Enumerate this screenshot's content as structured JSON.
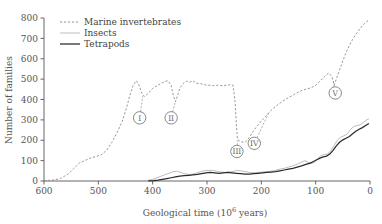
{
  "chart_data": {
    "type": "line",
    "title": "",
    "xlabel": "Geological time (10⁶ years)",
    "ylabel": "Number of families",
    "xlim": [
      600,
      0
    ],
    "ylim": [
      0,
      800
    ],
    "x_ticks": [
      600,
      500,
      400,
      300,
      200,
      100,
      0
    ],
    "y_ticks": [
      0,
      100,
      200,
      300,
      400,
      500,
      600,
      700,
      800
    ],
    "x_reversed": true,
    "grid": false,
    "legend_position": "top-left",
    "series": [
      {
        "name": "Marine invertebrates",
        "style": "dashed",
        "color": "#8c8c8c",
        "points": [
          [
            600,
            2
          ],
          [
            585,
            4
          ],
          [
            570,
            12
          ],
          [
            555,
            35
          ],
          [
            545,
            62
          ],
          [
            535,
            88
          ],
          [
            525,
            100
          ],
          [
            515,
            112
          ],
          [
            505,
            120
          ],
          [
            495,
            128
          ],
          [
            485,
            150
          ],
          [
            475,
            190
          ],
          [
            465,
            240
          ],
          [
            455,
            300
          ],
          [
            448,
            360
          ],
          [
            442,
            420
          ],
          [
            436,
            470
          ],
          [
            430,
            492
          ],
          [
            425,
            470
          ],
          [
            420,
            430
          ],
          [
            415,
            415
          ],
          [
            408,
            430
          ],
          [
            400,
            455
          ],
          [
            392,
            468
          ],
          [
            385,
            478
          ],
          [
            378,
            488
          ],
          [
            372,
            492
          ],
          [
            366,
            470
          ],
          [
            362,
            420
          ],
          [
            358,
            390
          ],
          [
            354,
            420
          ],
          [
            350,
            455
          ],
          [
            344,
            478
          ],
          [
            338,
            490
          ],
          [
            332,
            485
          ],
          [
            326,
            492
          ],
          [
            320,
            480
          ],
          [
            312,
            478
          ],
          [
            304,
            472
          ],
          [
            296,
            470
          ],
          [
            288,
            468
          ],
          [
            280,
            470
          ],
          [
            272,
            468
          ],
          [
            264,
            470
          ],
          [
            258,
            472
          ],
          [
            252,
            470
          ],
          [
            248,
            380
          ],
          [
            246,
            280
          ],
          [
            244,
            205
          ],
          [
            240,
            196
          ],
          [
            236,
            192
          ],
          [
            230,
            190
          ],
          [
            226,
            200
          ],
          [
            222,
            215
          ],
          [
            216,
            240
          ],
          [
            210,
            262
          ],
          [
            204,
            282
          ],
          [
            198,
            300
          ],
          [
            192,
            318
          ],
          [
            186,
            336
          ],
          [
            180,
            352
          ],
          [
            172,
            370
          ],
          [
            164,
            385
          ],
          [
            156,
            400
          ],
          [
            148,
            412
          ],
          [
            140,
            424
          ],
          [
            132,
            436
          ],
          [
            124,
            446
          ],
          [
            116,
            452
          ],
          [
            108,
            458
          ],
          [
            100,
            470
          ],
          [
            92,
            490
          ],
          [
            84,
            512
          ],
          [
            76,
            530
          ],
          [
            70,
            512
          ],
          [
            66,
            470
          ],
          [
            62,
            500
          ],
          [
            56,
            545
          ],
          [
            50,
            590
          ],
          [
            44,
            630
          ],
          [
            38,
            665
          ],
          [
            32,
            695
          ],
          [
            26,
            720
          ],
          [
            20,
            742
          ],
          [
            14,
            762
          ],
          [
            8,
            778
          ],
          [
            2,
            790
          ]
        ]
      },
      {
        "name": "Insects",
        "style": "solid-thin",
        "color": "#b0b0b0",
        "points": [
          [
            420,
            1
          ],
          [
            410,
            3
          ],
          [
            400,
            8
          ],
          [
            392,
            16
          ],
          [
            386,
            22
          ],
          [
            380,
            28
          ],
          [
            374,
            34
          ],
          [
            368,
            40
          ],
          [
            362,
            46
          ],
          [
            356,
            48
          ],
          [
            350,
            44
          ],
          [
            344,
            38
          ],
          [
            338,
            34
          ],
          [
            332,
            32
          ],
          [
            326,
            34
          ],
          [
            320,
            38
          ],
          [
            314,
            44
          ],
          [
            306,
            50
          ],
          [
            298,
            52
          ],
          [
            290,
            52
          ],
          [
            282,
            48
          ],
          [
            274,
            44
          ],
          [
            266,
            42
          ],
          [
            258,
            44
          ],
          [
            250,
            48
          ],
          [
            244,
            52
          ],
          [
            238,
            50
          ],
          [
            230,
            46
          ],
          [
            222,
            42
          ],
          [
            214,
            40
          ],
          [
            206,
            42
          ],
          [
            198,
            44
          ],
          [
            190,
            46
          ],
          [
            182,
            48
          ],
          [
            174,
            52
          ],
          [
            166,
            58
          ],
          [
            158,
            62
          ],
          [
            150,
            68
          ],
          [
            142,
            74
          ],
          [
            134,
            82
          ],
          [
            126,
            92
          ],
          [
            120,
            100
          ],
          [
            114,
            92
          ],
          [
            108,
            86
          ],
          [
            102,
            92
          ],
          [
            96,
            110
          ],
          [
            90,
            125
          ],
          [
            84,
            130
          ],
          [
            78,
            132
          ],
          [
            72,
            150
          ],
          [
            66,
            175
          ],
          [
            60,
            200
          ],
          [
            54,
            215
          ],
          [
            48,
            222
          ],
          [
            42,
            230
          ],
          [
            36,
            252
          ],
          [
            30,
            268
          ],
          [
            24,
            272
          ],
          [
            18,
            276
          ],
          [
            12,
            288
          ],
          [
            6,
            300
          ],
          [
            2,
            305
          ]
        ]
      },
      {
        "name": "Tetrapods",
        "style": "solid-thick",
        "color": "#2b2b2b",
        "points": [
          [
            408,
            1
          ],
          [
            398,
            2
          ],
          [
            390,
            4
          ],
          [
            382,
            8
          ],
          [
            374,
            12
          ],
          [
            366,
            16
          ],
          [
            358,
            20
          ],
          [
            350,
            24
          ],
          [
            342,
            26
          ],
          [
            334,
            28
          ],
          [
            326,
            30
          ],
          [
            318,
            32
          ],
          [
            310,
            36
          ],
          [
            302,
            40
          ],
          [
            294,
            42
          ],
          [
            286,
            40
          ],
          [
            278,
            38
          ],
          [
            270,
            40
          ],
          [
            262,
            42
          ],
          [
            254,
            40
          ],
          [
            246,
            38
          ],
          [
            238,
            36
          ],
          [
            230,
            34
          ],
          [
            222,
            34
          ],
          [
            214,
            36
          ],
          [
            206,
            38
          ],
          [
            198,
            40
          ],
          [
            190,
            42
          ],
          [
            182,
            44
          ],
          [
            174,
            46
          ],
          [
            166,
            50
          ],
          [
            158,
            54
          ],
          [
            150,
            58
          ],
          [
            142,
            62
          ],
          [
            134,
            68
          ],
          [
            126,
            74
          ],
          [
            118,
            82
          ],
          [
            110,
            88
          ],
          [
            104,
            96
          ],
          [
            98,
            104
          ],
          [
            92,
            112
          ],
          [
            86,
            118
          ],
          [
            80,
            122
          ],
          [
            74,
            132
          ],
          [
            68,
            150
          ],
          [
            62,
            172
          ],
          [
            56,
            190
          ],
          [
            50,
            202
          ],
          [
            44,
            210
          ],
          [
            38,
            218
          ],
          [
            32,
            232
          ],
          [
            26,
            244
          ],
          [
            20,
            254
          ],
          [
            14,
            262
          ],
          [
            8,
            272
          ],
          [
            2,
            282
          ]
        ]
      }
    ],
    "annotations": [
      {
        "label": "I",
        "x": 424,
        "y": 310,
        "anchor_x": 418,
        "anchor_y": 418
      },
      {
        "label": "II",
        "x": 366,
        "y": 310,
        "anchor_x": 358,
        "anchor_y": 392
      },
      {
        "label": "III",
        "x": 245,
        "y": 145,
        "anchor_x": 244,
        "anchor_y": 200
      },
      {
        "label": "IV",
        "x": 213,
        "y": 185,
        "anchor_x": 186,
        "anchor_y": 336
      },
      {
        "label": "V",
        "x": 64,
        "y": 432,
        "anchor_x": 68,
        "anchor_y": 498
      }
    ]
  },
  "legend": {
    "items": [
      {
        "label": "Marine invertebrates"
      },
      {
        "label": "Insects"
      },
      {
        "label": "Tetrapods"
      }
    ]
  }
}
